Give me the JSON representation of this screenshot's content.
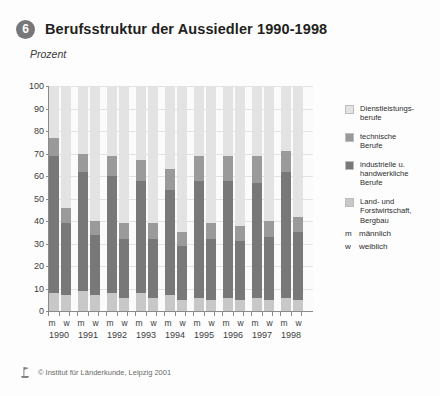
{
  "header": {
    "badge": "6",
    "title": "Berufsstruktur der Aussiedler 1990-1998",
    "unit": "Prozent"
  },
  "legend": {
    "items": [
      {
        "label": "Dienstleistungs-\nberufe",
        "color": "#e3e3e3"
      },
      {
        "label": "technische\nBerufe",
        "color": "#9a9a9a"
      },
      {
        "label": "industrielle u.\nhandwerkliche\nBerufe",
        "color": "#787878"
      },
      {
        "label": "Land- und\nForstwirtschaft,\nBergbau",
        "color": "#c8c8c8"
      }
    ],
    "keys": [
      {
        "key": "m",
        "label": "männlich"
      },
      {
        "key": "w",
        "label": "weiblich"
      }
    ]
  },
  "footer": {
    "credit": "© Institut für Länderkunde, Leipzig 2001"
  },
  "chart_data": {
    "type": "bar",
    "subtype": "stacked-100",
    "title": "Berufsstruktur der Aussiedler 1990-1998",
    "xlabel": "",
    "ylabel": "Prozent",
    "ylim": [
      0,
      100
    ],
    "yticks": [
      0,
      10,
      20,
      30,
      40,
      50,
      60,
      70,
      80,
      90,
      100
    ],
    "grid": true,
    "legend_position": "right",
    "categories": [
      "1990",
      "1991",
      "1992",
      "1993",
      "1994",
      "1995",
      "1996",
      "1997",
      "1998"
    ],
    "subcategories": [
      "m",
      "w"
    ],
    "series": [
      {
        "name": "Land- und Forstwirtschaft, Bergbau",
        "color": "#c8c8c8",
        "values_m": [
          8,
          9,
          8,
          8,
          7,
          6,
          6,
          6,
          6
        ],
        "values_w": [
          7,
          7,
          6,
          6,
          5,
          5,
          5,
          5,
          5
        ]
      },
      {
        "name": "industrielle u. handwerkliche Berufe",
        "color": "#787878",
        "values_m": [
          61,
          53,
          52,
          50,
          47,
          52,
          52,
          51,
          56
        ],
        "values_w": [
          32,
          27,
          26,
          26,
          24,
          27,
          26,
          28,
          30
        ]
      },
      {
        "name": "technische Berufe",
        "color": "#9a9a9a",
        "values_m": [
          8,
          8,
          9,
          9,
          9,
          11,
          11,
          12,
          9
        ],
        "values_w": [
          7,
          6,
          7,
          7,
          6,
          7,
          7,
          7,
          7
        ]
      },
      {
        "name": "Dienstleistungsberufe",
        "color": "#e3e3e3",
        "values_m": [
          23,
          30,
          31,
          33,
          37,
          31,
          31,
          31,
          29
        ],
        "values_w": [
          54,
          60,
          61,
          61,
          65,
          61,
          62,
          60,
          58
        ]
      }
    ]
  }
}
